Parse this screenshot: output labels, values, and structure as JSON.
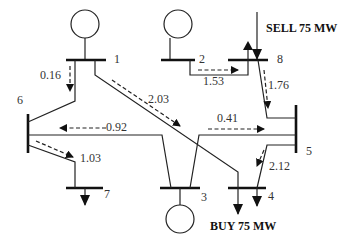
{
  "diagram": {
    "type": "power-system-one-line",
    "buses": [
      {
        "id": "1",
        "label": "1",
        "generator": true
      },
      {
        "id": "2",
        "label": "2",
        "generator": true
      },
      {
        "id": "3",
        "label": "3",
        "generator": true
      },
      {
        "id": "4",
        "label": "4",
        "load": true
      },
      {
        "id": "5",
        "label": "5"
      },
      {
        "id": "6",
        "label": "6"
      },
      {
        "id": "7",
        "label": "7",
        "load": true
      },
      {
        "id": "8",
        "label": "8"
      }
    ],
    "flows": [
      {
        "from": "1",
        "to": "6",
        "value": "0.16"
      },
      {
        "from": "1",
        "to": "4",
        "value": "2.03"
      },
      {
        "from": "2",
        "to": "8",
        "value": "1.53"
      },
      {
        "from": "8",
        "to": "5",
        "value": "1.76"
      },
      {
        "from": "3",
        "to": "6",
        "value": "0.92"
      },
      {
        "from": "3",
        "to": "5",
        "value": "0.41"
      },
      {
        "from": "6",
        "to": "7",
        "value": "1.03"
      },
      {
        "from": "5",
        "to": "4",
        "value": "2.12"
      }
    ],
    "annotations": {
      "sell": "SELL 75 MW",
      "buy": "BUY 75 MW"
    }
  }
}
